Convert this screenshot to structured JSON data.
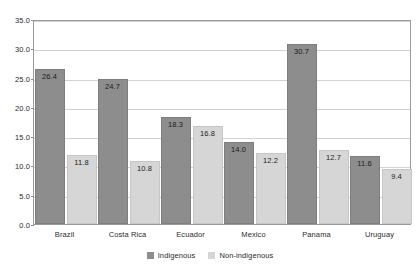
{
  "chart_data": {
    "type": "bar",
    "title": "",
    "xlabel": "",
    "ylabel": "",
    "ylim": [
      0.0,
      35.0
    ],
    "ytick_step": 5.0,
    "yticks": [
      "0.0",
      "5.0",
      "10.0",
      "15.0",
      "20.0",
      "25.0",
      "30.0",
      "35.0"
    ],
    "grid": true,
    "legend_position": "bottom-center",
    "categories": [
      "Brazil",
      "Costa Rica",
      "Ecuador",
      "Mexico",
      "Panama",
      "Uruguay"
    ],
    "series": [
      {
        "name": "Indigenous",
        "color": "#8d8d8d",
        "values": [
          26.4,
          24.7,
          18.3,
          14.0,
          30.7,
          11.6
        ],
        "labels": [
          "26.4",
          "24.7",
          "18.3",
          "14.0",
          "30.7",
          "11.6"
        ]
      },
      {
        "name": "Non-indigenous",
        "color": "#d6d6d6",
        "values": [
          11.8,
          10.8,
          16.8,
          12.2,
          12.7,
          9.4
        ],
        "labels": [
          "11.8",
          "10.8",
          "16.8",
          "12.2",
          "12.7",
          "9.4"
        ]
      }
    ]
  },
  "legend": {
    "items": [
      {
        "label": "Indigenous"
      },
      {
        "label": "Non-indigenous"
      }
    ]
  }
}
